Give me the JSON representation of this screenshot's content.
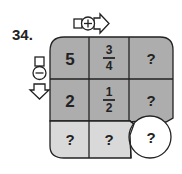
{
  "problem_number": "34.",
  "operators": {
    "horizontal": {
      "symbol": "+",
      "direction": "right"
    },
    "vertical": {
      "symbol": "−",
      "direction": "down"
    }
  },
  "grid": {
    "rows": [
      [
        {
          "value": "5"
        },
        {
          "num": "3",
          "den": "4"
        },
        {
          "value": "?"
        }
      ],
      [
        {
          "value": "2"
        },
        {
          "num": "1",
          "den": "2"
        },
        {
          "value": "?"
        }
      ],
      [
        {
          "value": "?"
        },
        {
          "value": "?"
        },
        {
          "value": "?"
        }
      ]
    ]
  },
  "colors": {
    "dark_cell": "#adadad",
    "light_cell": "#d9d9d9",
    "circle": "#ffffff",
    "line": "#222222"
  }
}
